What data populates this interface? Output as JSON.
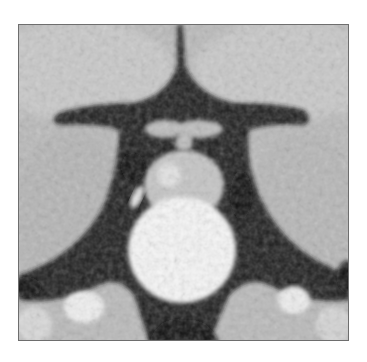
{
  "image": {
    "description": "Coronal MRI slice of sellar region showing a bright rounded mass below a grayish structure, flanked by dark vascular flow voids",
    "colors": {
      "background": "#ffffff",
      "brain_tissue": "#bdbdbd",
      "csf_dark": "#1a1a1a",
      "mass_bright": "#f8f8f8",
      "border": "#6e6e6e"
    }
  }
}
